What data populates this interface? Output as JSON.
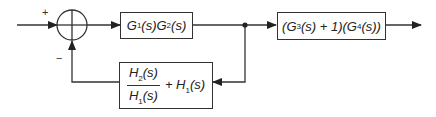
{
  "diagram": {
    "type": "control-system-block-diagram",
    "summing_junction": {
      "plus_sign": "+",
      "minus_sign": "−"
    },
    "blocks": {
      "forward1": {
        "label": "G1(s)G2(s)",
        "parts": [
          "G",
          "1",
          "(s)G",
          "2",
          "(s)"
        ]
      },
      "forward2": {
        "label": "(G3(s) + 1)(G4(s))",
        "parts": [
          "(G",
          "3",
          "(s) + 1)(G",
          "4",
          "(s))"
        ]
      },
      "feedback": {
        "label": "H2(s)/H1(s) + H1(s)",
        "numerator": [
          "H",
          "2",
          "(s)"
        ],
        "denominator": [
          "H",
          "1",
          "(s)"
        ],
        "addend": [
          "+ H",
          "1",
          "(s)"
        ]
      }
    },
    "colors": {
      "line": "#333333",
      "background": "#ffffff"
    }
  }
}
